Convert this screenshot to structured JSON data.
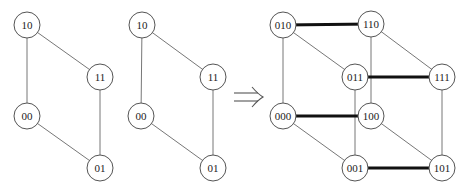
{
  "diagram": {
    "type": "graph-construction",
    "colors": {
      "node_stroke": "#555555",
      "edge": "#777777",
      "bold_edge": "#111111",
      "text": "#222222",
      "arrow": "#555555"
    },
    "arrow_symbol": "⇒",
    "graphs": [
      {
        "id": "square-a",
        "nodes": [
          "10",
          "11",
          "00",
          "01"
        ],
        "edges": [
          [
            "10",
            "11"
          ],
          [
            "10",
            "00"
          ],
          [
            "11",
            "01"
          ],
          [
            "00",
            "01"
          ]
        ]
      },
      {
        "id": "square-b",
        "nodes": [
          "10",
          "11",
          "00",
          "01"
        ],
        "edges": [
          [
            "10",
            "11"
          ],
          [
            "10",
            "00"
          ],
          [
            "11",
            "01"
          ],
          [
            "00",
            "01"
          ]
        ]
      },
      {
        "id": "cube",
        "nodes": [
          "010",
          "110",
          "011",
          "111",
          "000",
          "100",
          "001",
          "101"
        ],
        "edges": [
          [
            "010",
            "011"
          ],
          [
            "010",
            "000"
          ],
          [
            "011",
            "001"
          ],
          [
            "000",
            "001"
          ],
          [
            "110",
            "111"
          ],
          [
            "110",
            "100"
          ],
          [
            "111",
            "101"
          ],
          [
            "100",
            "101"
          ]
        ],
        "bold_edges": [
          [
            "010",
            "110"
          ],
          [
            "011",
            "111"
          ],
          [
            "000",
            "100"
          ],
          [
            "001",
            "101"
          ]
        ]
      }
    ]
  }
}
